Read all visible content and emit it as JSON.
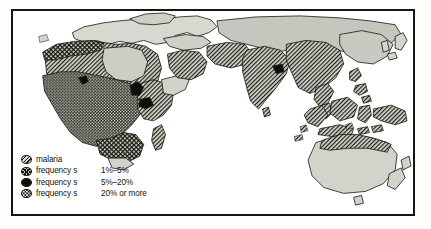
{
  "figure": {
    "kind": "thematic-world-map",
    "frame_color": "#16150f",
    "background_color": "#ffffff"
  },
  "legend": {
    "rows": [
      {
        "swatch": "diagonal-hatch-swatch",
        "label": "malaria",
        "value": ""
      },
      {
        "swatch": "cross-hatch-swatch",
        "label": "frequency s",
        "value": "1%–5%"
      },
      {
        "swatch": "solid-black-swatch",
        "label": "frequency s",
        "value": "5%–20%"
      },
      {
        "swatch": "stipple-swatch",
        "label": "frequency s",
        "value": "20% or more"
      }
    ]
  },
  "map_regions": {
    "malaria_hatch": [
      "North Africa / Sahara",
      "Horn of Africa",
      "Arabian Peninsula",
      "Iran",
      "Indian subcontinent",
      "Mainland Southeast Asia",
      "Southern China",
      "Indonesia",
      "New Guinea",
      "Northern Australia"
    ],
    "frequency_1_to_5": [
      "Mediterranean coast of North Africa",
      "Southern Europe margin",
      "Southern Africa band"
    ],
    "frequency_5_to_20": [
      "Central Africa pockets",
      "Eastern Africa pockets"
    ],
    "frequency_20_or_more": [
      "West Africa",
      "Central Africa",
      "Congo Basin",
      "Great Lakes region"
    ],
    "unshaded_land": [
      "Europe",
      "Central Asia",
      "Japan",
      "Southern Australia",
      "New Zealand",
      "Madagascar interior"
    ]
  },
  "palette": {
    "ink": "#15140e",
    "land_light": "#d6d6cf",
    "land_mid": "#b7b7ae",
    "sea": "#ffffff",
    "high_fill": "#15140e"
  }
}
